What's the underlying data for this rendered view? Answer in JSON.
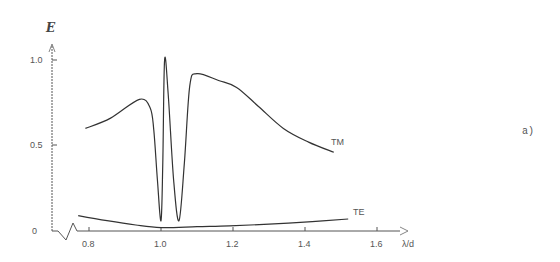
{
  "chart_data": {
    "type": "line",
    "title": "",
    "xlabel": "λ/d",
    "ylabel": "E",
    "panel_label": "a)",
    "xlim": [
      0.7,
      1.7
    ],
    "ylim": [
      0,
      1.05
    ],
    "x_ticks": [
      "0.8",
      "1.0",
      "1.2",
      "1.4",
      "1.6"
    ],
    "y_ticks": [
      "0",
      "0.5",
      "1.0"
    ],
    "grid": false,
    "legend": "inline labels",
    "series": [
      {
        "name": "TM",
        "points": [
          [
            0.79,
            0.6
          ],
          [
            0.86,
            0.66
          ],
          [
            0.94,
            0.77
          ],
          [
            0.97,
            0.72
          ],
          [
            0.98,
            0.59
          ],
          [
            0.99,
            0.3
          ],
          [
            1.0,
            0.06
          ],
          [
            1.005,
            0.4
          ],
          [
            1.01,
            1.0
          ],
          [
            1.02,
            0.8
          ],
          [
            1.035,
            0.3
          ],
          [
            1.05,
            0.06
          ],
          [
            1.065,
            0.4
          ],
          [
            1.08,
            0.85
          ],
          [
            1.1,
            0.92
          ],
          [
            1.16,
            0.88
          ],
          [
            1.21,
            0.84
          ],
          [
            1.27,
            0.73
          ],
          [
            1.34,
            0.6
          ],
          [
            1.41,
            0.52
          ],
          [
            1.48,
            0.46
          ]
        ]
      },
      {
        "name": "TE",
        "points": [
          [
            0.77,
            0.09
          ],
          [
            0.85,
            0.06
          ],
          [
            0.93,
            0.035
          ],
          [
            1.0,
            0.02
          ],
          [
            1.1,
            0.025
          ],
          [
            1.19,
            0.03
          ],
          [
            1.3,
            0.04
          ],
          [
            1.42,
            0.055
          ],
          [
            1.52,
            0.07
          ]
        ]
      }
    ]
  },
  "labels": {
    "ylabel": "E",
    "xlabel": "λ/d",
    "panel": "a)",
    "tm": "TM",
    "te": "TE",
    "ytick_0": "0",
    "ytick_05": "0.5",
    "ytick_10": "1.0",
    "xtick_08": "0.8",
    "xtick_10": "1.0",
    "xtick_12": "1.2",
    "xtick_14": "1.4",
    "xtick_16": "1.6"
  }
}
